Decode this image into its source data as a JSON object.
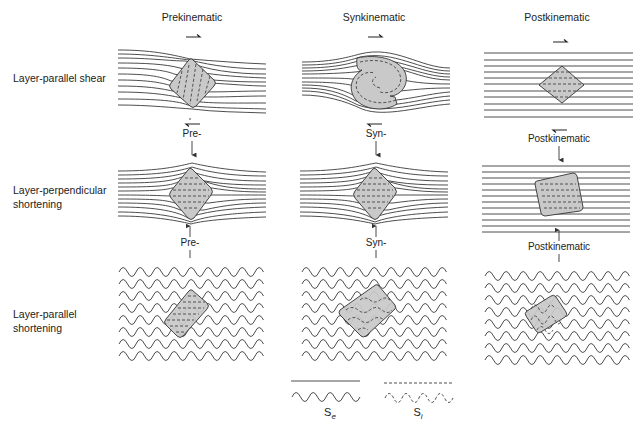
{
  "figure": {
    "columns": [
      {
        "id": "prekinematic",
        "header": "Prekinematic",
        "x": 192
      },
      {
        "id": "synkinematic",
        "header": "Synkinematic",
        "x": 374
      },
      {
        "id": "postkinematic",
        "header": "Postkinematic",
        "x": 557
      }
    ],
    "rows": [
      {
        "id": "layer-parallel-shear",
        "label_line1": "Layer-parallel shear",
        "label_line2": ""
      },
      {
        "id": "layer-perpendicular-shortening",
        "label_line1": "Layer-perpendicular",
        "label_line2": "shortening"
      },
      {
        "id": "layer-parallel-shortening",
        "label_line1": "Layer-parallel",
        "label_line2": "shortening"
      }
    ],
    "between_labels": {
      "row1_to_row2": [
        "Pre-",
        "Syn-",
        "Postkinematic"
      ],
      "row2_to_row3": [
        "Pre-",
        "Syn-",
        "Postkinematic"
      ]
    },
    "legend": {
      "external_foliation": {
        "symbol": "S",
        "subscript": "e"
      },
      "internal_foliation": {
        "symbol": "S",
        "subscript": "i"
      }
    },
    "colors": {
      "line": "#3a3a3a",
      "porphyroblast_fill": "#c9c9c9",
      "porphyroblast_stroke": "#333333",
      "inclusion_trail": "#444444"
    }
  }
}
